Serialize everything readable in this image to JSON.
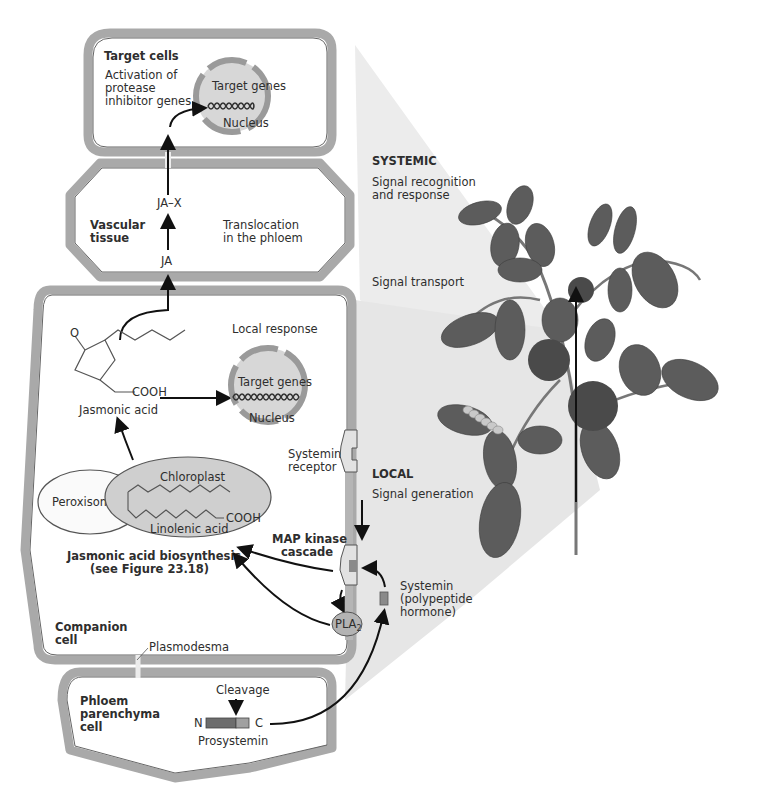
{
  "figure": {
    "colors": {
      "cell_fill": "#ececec",
      "cell_wall": "#a9a9a9",
      "organelle": "#cfcfcf",
      "nucleus_ring": "#9a9a9a",
      "beam": "#e4e4e4",
      "leaf": "#555555",
      "tomato": "#5a5a5a"
    },
    "target_cell": {
      "title": "Target cells",
      "description_lines": [
        "Activation of",
        "protease",
        "inhibitor genes"
      ],
      "nucleus": {
        "genes_label": "Target genes",
        "label": "Nucleus"
      }
    },
    "vascular": {
      "title_lines": [
        "Vascular",
        "tissue"
      ],
      "description_lines": [
        "Translocation",
        "in the phloem"
      ],
      "ja_x": "JA–X",
      "ja": "JA"
    },
    "companion_cell": {
      "title_lines": [
        "Companion",
        "cell"
      ],
      "local_response": "Local response",
      "nucleus": {
        "genes_label": "Target genes",
        "label": "Nucleus"
      },
      "jasmonic_acid": {
        "label": "Jasmonic acid",
        "group_o": "O",
        "group_cooh": "COOH"
      },
      "peroxisome": "Peroxisome",
      "chloroplast": {
        "label": "Chloroplast",
        "molecule": "Linolenic acid",
        "group_cooh": "COOH"
      },
      "biosynthesis_lines": [
        "Jasmonic acid biosynthesis",
        "(see Figure 23.18)"
      ],
      "systemin_receptor_lines": [
        "Systemin",
        "receptor"
      ],
      "map_kinase_lines": [
        "MAP kinase",
        "cascade"
      ],
      "pla2": "PLA",
      "pla2_sub": "2"
    },
    "plasmodesma": "Plasmodesma",
    "phloem_parenchyma": {
      "title_lines": [
        "Phloem",
        "parenchyma",
        "cell"
      ],
      "cleavage": "Cleavage",
      "n_term": "N",
      "c_term": "C",
      "prosystemin": "Prosystemin"
    },
    "systemin_lines": [
      "Systemin",
      "(polypeptide",
      "hormone)"
    ],
    "levels": {
      "systemic": "SYSTEMIC",
      "signal_recognition_lines": [
        "Signal recognition",
        "and response"
      ],
      "signal_transport": "Signal transport",
      "local": "LOCAL",
      "signal_generation": "Signal generation"
    }
  }
}
